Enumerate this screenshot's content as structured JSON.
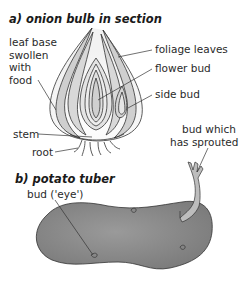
{
  "onion": {
    "title": "a) onion bulb in section",
    "labels": {
      "leaf_base": [
        "leaf base",
        "swollen",
        "with",
        "food"
      ],
      "foliage_leaves": "foliage leaves",
      "flower_bud": "flower bud",
      "side_bud": "side bud",
      "stem": "stem",
      "root": "root"
    }
  },
  "potato": {
    "title": "b) potato tuber",
    "labels": {
      "bud_eye": "bud ('eye')",
      "sprouted": [
        "bud which",
        "has sprouted"
      ]
    }
  },
  "colors": {
    "tuber_fill": "#8a8a8a",
    "leaf_fill": "#cfcfcf",
    "outline": "#333333"
  }
}
